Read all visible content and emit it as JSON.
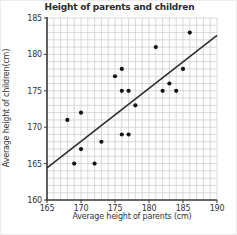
{
  "chart_data": {
    "type": "scatter",
    "title": "Height of parents and children",
    "xlabel": "Average height of parents (cm)",
    "ylabel": "Average height of children(cm)",
    "xlim": [
      165,
      190
    ],
    "ylim": [
      160,
      185
    ],
    "x_ticks": [
      165,
      170,
      175,
      180,
      185,
      190
    ],
    "y_ticks": [
      160,
      165,
      170,
      175,
      180,
      185
    ],
    "grid": "minor gridlines every 1 cm, both axes",
    "legend": "none",
    "points": [
      [
        168,
        171
      ],
      [
        169,
        165
      ],
      [
        170,
        167
      ],
      [
        170,
        172
      ],
      [
        172,
        165
      ],
      [
        173,
        168
      ],
      [
        175,
        177
      ],
      [
        176,
        169
      ],
      [
        176,
        175
      ],
      [
        176,
        178
      ],
      [
        177,
        169
      ],
      [
        177,
        175
      ],
      [
        178,
        173
      ],
      [
        181,
        181
      ],
      [
        182,
        175
      ],
      [
        183,
        176
      ],
      [
        184,
        175
      ],
      [
        185,
        178
      ],
      [
        186,
        183
      ]
    ],
    "trend_line": {
      "x1": 165,
      "y1": 164.4,
      "x2": 190,
      "y2": 182.6
    },
    "colors": {
      "point": "#151515",
      "trend_line": "#2e2e2e",
      "grid": "#c9c9c9",
      "axis": "#3b3b3b",
      "text": "#333333",
      "background": "#ffffff"
    }
  }
}
